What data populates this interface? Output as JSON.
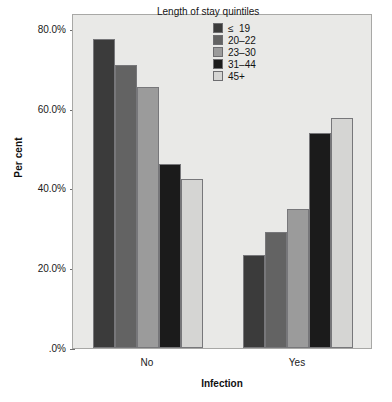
{
  "chart_data": {
    "type": "bar",
    "title": "",
    "xlabel": "Infection",
    "ylabel": "Per cent",
    "categories": [
      "No",
      "Yes"
    ],
    "series": [
      {
        "name": "≤  19",
        "values": [
          77.5,
          23.3
        ],
        "color": "#3b3b3b"
      },
      {
        "name": "20–22",
        "values": [
          71.0,
          29.2
        ],
        "color": "#636363"
      },
      {
        "name": "23–30",
        "values": [
          65.5,
          34.8
        ],
        "color": "#9b9b9b"
      },
      {
        "name": "31–44",
        "values": [
          46.1,
          54.0
        ],
        "color": "#1b1b1b"
      },
      {
        "name": "45+",
        "values": [
          42.3,
          57.8
        ],
        "color": "#d5d5d3"
      }
    ],
    "ylim": [
      0,
      84
    ],
    "yticks": [
      0,
      20,
      40,
      60,
      80
    ],
    "ytick_labels": [
      ".0%",
      "20.0%",
      "40.0%",
      "60.0%",
      "80.0%"
    ],
    "grid": false,
    "legend_position": "top-right",
    "legend_title": "Length of stay quintiles"
  },
  "axes": {
    "y_title": "Per cent",
    "x_title": "Infection"
  },
  "legend": {
    "title": "Length of stay quintiles",
    "entries": [
      {
        "label": "≤  19"
      },
      {
        "label": "20–22"
      },
      {
        "label": "23–30"
      },
      {
        "label": "31–44"
      },
      {
        "label": "45+"
      }
    ]
  },
  "colors": {
    "plot_background": "#e9e9e7",
    "frame_border": "#a8a8a6",
    "bar_outline": "#77777a"
  }
}
